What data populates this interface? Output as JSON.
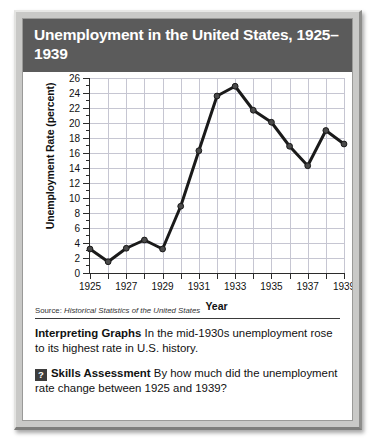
{
  "title": "Unemployment in the United States, 1925–1939",
  "source": {
    "label": "Source:",
    "text": "Historical Statistics of the United States"
  },
  "caption": {
    "heading": "Interpreting Graphs",
    "text": "In the mid-1930s unemployment rose to its highest rate in U.S. history."
  },
  "skills": {
    "badge": "?",
    "heading": "Skills Assessment",
    "text": "By how much did the unemployment rate change between 1925 and 1939?"
  },
  "colors": {
    "banner": "#5b5b5b",
    "frame": "#c9c9c7",
    "line": "#1a1a1a",
    "grid": "#c6c6d2",
    "axis": "#2b2b2b"
  },
  "chart_data": {
    "type": "line",
    "title": "Unemployment in the United States, 1925–1939",
    "xlabel": "Year",
    "ylabel": "Unemployment Rate (percent)",
    "x": [
      1925,
      1926,
      1927,
      1928,
      1929,
      1930,
      1931,
      1932,
      1933,
      1934,
      1935,
      1936,
      1937,
      1938,
      1939
    ],
    "values": [
      3.2,
      1.5,
      3.3,
      4.4,
      3.2,
      8.9,
      16.3,
      23.6,
      24.9,
      21.7,
      20.1,
      16.9,
      14.3,
      19.0,
      17.2
    ],
    "xlim": [
      1925,
      1939
    ],
    "ylim": [
      0,
      26
    ],
    "ytick_labels": [
      "0",
      "2",
      "4",
      "6",
      "8",
      "10",
      "12",
      "14",
      "16",
      "18",
      "20",
      "22",
      "24",
      "26"
    ],
    "ytick_values": [
      0,
      2,
      4,
      6,
      8,
      10,
      12,
      14,
      16,
      18,
      20,
      22,
      24,
      26
    ],
    "ytick_minor_values": [
      1,
      3,
      5,
      7,
      9,
      11,
      13,
      15,
      17,
      19,
      21,
      23,
      25
    ],
    "xtick_labels": [
      "1925",
      "1927",
      "1929",
      "1931",
      "1933",
      "1935",
      "1937",
      "1939"
    ],
    "xtick_values": [
      1925,
      1927,
      1929,
      1931,
      1933,
      1935,
      1937,
      1939
    ],
    "grid": true,
    "legend": "none",
    "marker": "circle"
  }
}
